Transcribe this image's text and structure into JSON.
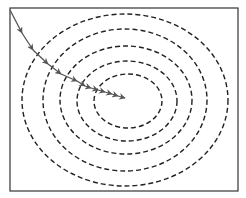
{
  "diagram": {
    "type": "gradient-descent-contour",
    "background": "#ffffff",
    "frame": {
      "x": 10,
      "y": 8,
      "width": 228,
      "height": 183,
      "stroke": "#333333",
      "stroke_width": 1.2
    },
    "contours": {
      "stroke": "#222222",
      "dash": "5 3",
      "stroke_width": 1.4,
      "ellipses": [
        {
          "cx": 128,
          "cy": 101,
          "rx": 34,
          "ry": 27
        },
        {
          "cx": 127,
          "cy": 101,
          "rx": 50,
          "ry": 40
        },
        {
          "cx": 126,
          "cy": 100,
          "rx": 66,
          "ry": 54
        },
        {
          "cx": 125,
          "cy": 100,
          "rx": 82,
          "ry": 71
        },
        {
          "cx": 125,
          "cy": 100,
          "rx": 103,
          "ry": 86
        }
      ]
    },
    "path": {
      "stroke": "#555555",
      "stroke_width": 1.3,
      "points": [
        [
          10,
          10
        ],
        [
          22,
          33
        ],
        [
          33,
          50
        ],
        [
          48,
          64
        ],
        [
          61,
          74
        ],
        [
          77,
          81
        ],
        [
          85,
          86
        ],
        [
          91,
          88
        ],
        [
          98,
          90
        ],
        [
          105,
          92
        ],
        [
          112,
          94
        ],
        [
          118,
          96
        ],
        [
          125,
          98
        ]
      ]
    }
  }
}
